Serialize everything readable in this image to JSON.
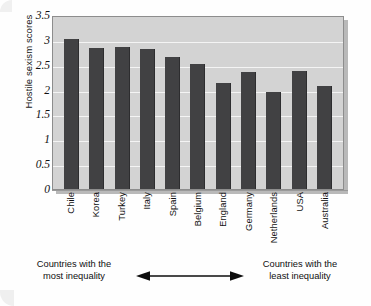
{
  "chart_data": {
    "type": "bar",
    "title": "",
    "xlabel": "",
    "ylabel": "Hostile sexism scores",
    "ylim": [
      0,
      3.5
    ],
    "grid": true,
    "legend": "none",
    "yticks": [
      "3.5",
      "3",
      "2.5",
      "2",
      "1.5",
      "1",
      "0.5",
      "0"
    ],
    "ytick_values": [
      3.5,
      3,
      2.5,
      2,
      1.5,
      1,
      0.5,
      0
    ],
    "categories": [
      "Chile",
      "Korea",
      "Turkey",
      "Italy",
      "Spain",
      "Belgium",
      "England",
      "Germany",
      "Netherlands",
      "USA",
      "Australia"
    ],
    "values": [
      3.01,
      2.83,
      2.85,
      2.82,
      2.65,
      2.51,
      2.13,
      2.35,
      1.96,
      2.37,
      2.07
    ],
    "series": [
      {
        "name": "Hostile sexism scores",
        "values": [
          3.01,
          2.83,
          2.85,
          2.82,
          2.65,
          2.51,
          2.13,
          2.35,
          1.96,
          2.37,
          2.07
        ]
      }
    ],
    "annotations": {
      "left_caption": "Countries with the\nmost inequality",
      "left_caption_line1": "Countries with the",
      "left_caption_line2": "most inequality",
      "right_caption_line1": "Countries with the",
      "right_caption_line2": "least inequality",
      "arrow": "double-headed-horizontal-arrow"
    },
    "colors": {
      "bar": "#414143",
      "plot_background": "#d3d3d3",
      "gridline": "#f4f4f4",
      "axis": "#8d8d8d",
      "text": "#101010",
      "page_background": "#fefefe"
    }
  }
}
